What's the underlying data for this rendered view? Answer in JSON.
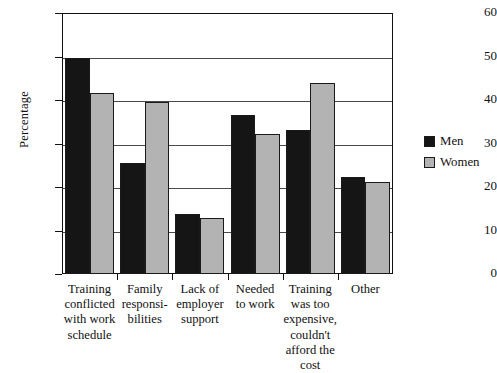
{
  "chart_data": {
    "type": "bar",
    "title": "",
    "subtitle": "",
    "xlabel": "",
    "ylabel": "Percentage",
    "ylim": [
      0,
      60
    ],
    "yticks": [
      0,
      10,
      20,
      30,
      40,
      50,
      60
    ],
    "grid": true,
    "grid_axis": "y",
    "legend_position": "right",
    "categories": [
      "Training conflicted with work schedule",
      "Family responsibilities",
      "Lack of employer support",
      "Needed to work",
      "Training was too expensive, couldn't afford the cost",
      "Other"
    ],
    "category_lines": [
      [
        "Training",
        "conflicted",
        "with work",
        "schedule"
      ],
      [
        "Family",
        "responsi-",
        "bilities"
      ],
      [
        "Lack of",
        "employer",
        "support"
      ],
      [
        "Needed",
        "to work"
      ],
      [
        "Training",
        "was too",
        "expensive,",
        "couldn't",
        "afford the",
        "cost"
      ],
      [
        "Other"
      ]
    ],
    "series": [
      {
        "name": "Men",
        "color": "#151515",
        "values": [
          49.7,
          25.5,
          13.7,
          36.6,
          33.1,
          22.3
        ]
      },
      {
        "name": "Women",
        "color": "#b3b3b3",
        "values": [
          41.5,
          39.6,
          12.8,
          32.2,
          44.0,
          21.2
        ]
      }
    ]
  },
  "legend": {
    "items": [
      {
        "label": "Men",
        "swatch": "men-swatch"
      },
      {
        "label": "Women",
        "swatch": "women-swatch"
      }
    ]
  },
  "axis": {
    "y_title": "Percentage"
  }
}
